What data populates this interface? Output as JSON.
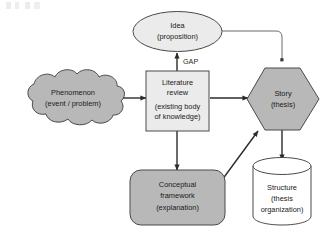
{
  "diagram": {
    "palette": {
      "fill_light": "#ebebeb",
      "fill_medium": "#b8b8b8",
      "fill_white": "#ffffff",
      "stroke": "#4a4a4a",
      "connector": "#2b2b2b",
      "connector_thin": "#6b6b6b",
      "text": "#1a1a1a",
      "background": "#ffffff"
    },
    "nodes": [
      {
        "id": "idea",
        "shape": "ellipse",
        "fill": "#ebebeb",
        "lines": [
          "Idea",
          "(proposition)"
        ]
      },
      {
        "id": "phenomenon",
        "shape": "cloud",
        "fill": "#b8b8b8",
        "lines": [
          "Phenomenon",
          "(event / problem)"
        ]
      },
      {
        "id": "literature-review",
        "shape": "rectangle",
        "fill": "#ebebeb",
        "lines": [
          "Literature",
          "review",
          "(existing body",
          "of knowledge)"
        ]
      },
      {
        "id": "story",
        "shape": "hexagon",
        "fill": "#b8b8b8",
        "lines": [
          "Story",
          "(thesis)"
        ]
      },
      {
        "id": "conceptual-framework",
        "shape": "rounded-rectangle",
        "fill": "#b8b8b8",
        "lines": [
          "Conceptual",
          "framework",
          "(explanation)"
        ]
      },
      {
        "id": "structure",
        "shape": "cylinder",
        "fill": "#ffffff",
        "lines": [
          "Structure",
          "(thesis",
          "organization)"
        ]
      }
    ],
    "edges": [
      {
        "id": "phenomenon-to-literature",
        "from": "phenomenon",
        "to": "literature-review",
        "label": ""
      },
      {
        "id": "literature-to-idea",
        "from": "literature-review",
        "to": "idea",
        "label": "GAP"
      },
      {
        "id": "literature-to-story",
        "from": "literature-review",
        "to": "story",
        "label": ""
      },
      {
        "id": "literature-to-framework",
        "from": "literature-review",
        "to": "conceptual-framework",
        "label": ""
      },
      {
        "id": "framework-to-story",
        "from": "conceptual-framework",
        "to": "story",
        "label": ""
      },
      {
        "id": "story-to-structure",
        "from": "story",
        "to": "structure",
        "label": ""
      },
      {
        "id": "idea-to-story",
        "from": "idea",
        "to": "story",
        "label": ""
      }
    ]
  }
}
